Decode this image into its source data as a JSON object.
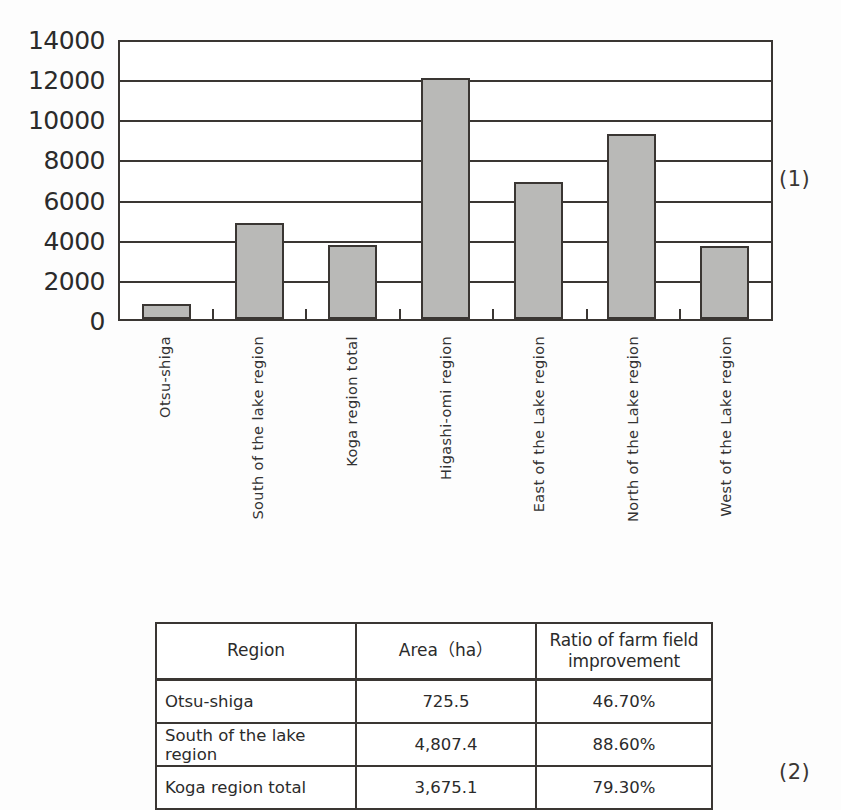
{
  "chart_data": {
    "type": "bar",
    "title": "",
    "xlabel": "",
    "ylabel": "",
    "ylim": [
      0,
      14000
    ],
    "ytick_step": 2000,
    "ytick_labels": [
      "14000",
      "12000",
      "10000",
      "8000",
      "6000",
      "4000",
      "2000",
      "0"
    ],
    "ytick_values": [
      14000,
      12000,
      10000,
      8000,
      6000,
      4000,
      2000,
      0
    ],
    "grid": true,
    "legend": false,
    "bar_fill_color": "#b9b9b7",
    "bar_edge_color": "#3a3633",
    "categories": [
      "Otsu-shiga",
      "South of the lake region",
      "Koga region total",
      "Higashi-omi region",
      "East of the Lake region",
      "North of the Lake region",
      "West of the Lake region"
    ],
    "values": [
      725.5,
      4807.4,
      3675.1,
      12000,
      6850,
      9200,
      3650
    ]
  },
  "figure_1": {
    "number_label": "(1)"
  },
  "figure_2": {
    "number_label": "(2)",
    "table": {
      "headers": [
        "Region",
        "Area（ha）",
        "Ratio of farm field improvement"
      ],
      "header_ratio_line1": "Ratio of farm field",
      "header_ratio_line2": "improvement",
      "rows": [
        {
          "region": "Otsu-shiga",
          "area": "725.5",
          "ratio": "46.70%"
        },
        {
          "region": "South of the lake region",
          "area": "4,807.4",
          "ratio": "88.60%"
        },
        {
          "region": "Koga region total",
          "area": "3,675.1",
          "ratio": "79.30%"
        }
      ]
    }
  }
}
